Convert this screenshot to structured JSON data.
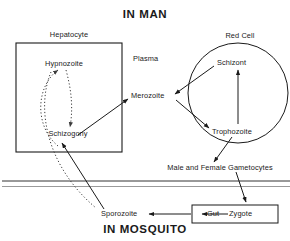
{
  "diagram": {
    "type": "life-cycle-flow-diagram",
    "titles": {
      "top": "IN MAN",
      "bottom": "IN MOSQUITO"
    },
    "regions": [
      {
        "id": "hepatocyte",
        "label": "Hepatocyte",
        "shape": "rectangle"
      },
      {
        "id": "red-cell",
        "label": "Red Cell",
        "shape": "circle"
      },
      {
        "id": "plasma",
        "label": "Plasma",
        "shape": "open-space"
      },
      {
        "id": "gut",
        "label": "Gut",
        "shape": "rectangle"
      }
    ],
    "nodes": [
      {
        "id": "hypnozoite",
        "label": "Hypnozoite"
      },
      {
        "id": "schizogony",
        "label": "Schizogony"
      },
      {
        "id": "merozoite",
        "label": "Merozoite"
      },
      {
        "id": "schizont",
        "label": "Schizont"
      },
      {
        "id": "trophozoite",
        "label": "Trophozoite"
      },
      {
        "id": "gametocytes",
        "label": "Male and Female Gametocytes"
      },
      {
        "id": "sporozoite",
        "label": "Sporozoite"
      },
      {
        "id": "zygote",
        "label": "Zygote"
      }
    ],
    "edges": [
      {
        "from": "sporozoite",
        "to": "schizogony",
        "style": "solid"
      },
      {
        "from": "schizogony",
        "to": "hypnozoite",
        "style": "dotted"
      },
      {
        "from": "hypnozoite",
        "to": "schizogony",
        "style": "dotted"
      },
      {
        "from": "hypnozoite",
        "to": "sporozoite",
        "style": "dotted"
      },
      {
        "from": "schizogony",
        "to": "merozoite",
        "style": "solid"
      },
      {
        "from": "merozoite",
        "to": "trophozoite",
        "style": "solid"
      },
      {
        "from": "trophozoite",
        "to": "schizont",
        "style": "solid"
      },
      {
        "from": "schizont",
        "to": "merozoite",
        "style": "solid"
      },
      {
        "from": "trophozoite",
        "to": "gametocytes",
        "style": "solid"
      },
      {
        "from": "gametocytes",
        "to": "zygote",
        "style": "solid"
      },
      {
        "from": "zygote",
        "to": "gut",
        "style": "solid"
      },
      {
        "from": "gut",
        "to": "sporozoite",
        "style": "solid"
      }
    ],
    "colors": {
      "stroke": "#1a1a1a",
      "boundary_line_dark": "#333333",
      "boundary_line_light": "#9a9a9a",
      "background": "#ffffff"
    }
  }
}
